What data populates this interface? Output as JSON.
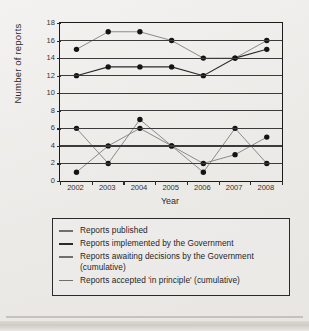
{
  "chart_data": {
    "type": "line",
    "title": "",
    "xlabel": "Year",
    "ylabel": "Number of reports",
    "categories": [
      "2002",
      "2003",
      "2004",
      "2005",
      "2006",
      "2007",
      "2008"
    ],
    "x": [
      2002,
      2003,
      2004,
      2005,
      2006,
      2007,
      2008
    ],
    "xlim": [
      2002,
      2008
    ],
    "ylim": [
      0,
      18
    ],
    "yticks": [
      0,
      2,
      4,
      6,
      8,
      10,
      12,
      14,
      16,
      18
    ],
    "grid": true,
    "legend_position": "below",
    "series": [
      {
        "name": "Reports published",
        "color": "#8a8a8a",
        "values": [
          15,
          17,
          17,
          16,
          14,
          14,
          16
        ]
      },
      {
        "name": "Reports implemented by the Government",
        "color": "#2a2a2a",
        "values": [
          12,
          13,
          13,
          13,
          12,
          14,
          15
        ]
      },
      {
        "name": "Reports awaiting decisions by the Government (cumulative)",
        "color": "#8a8a8a",
        "values": [
          6,
          2,
          7,
          4,
          1,
          6,
          2
        ]
      },
      {
        "name": "Reports accepted 'in principle' (cumulative)",
        "color": "#8a8a8a",
        "values": [
          1,
          4,
          6,
          4,
          2,
          3,
          5
        ]
      }
    ]
  },
  "axis": {
    "ylabel": "Number of reports",
    "xlabel": "Year",
    "yticks": [
      "18",
      "16",
      "14",
      "12",
      "10",
      "8",
      "6",
      "4",
      "2",
      "0"
    ],
    "xticks": [
      "2002",
      "2003",
      "2004",
      "2005",
      "2006",
      "2007",
      "2008"
    ]
  },
  "legend": {
    "items": [
      {
        "label": "Reports published",
        "style": "light"
      },
      {
        "label": "Reports implemented by the Government",
        "style": "dark"
      },
      {
        "label": "Reports awaiting decisions by the Government (cumulative)",
        "style": "light"
      },
      {
        "label": "Reports accepted 'in principle' (cumulative)",
        "style": "light"
      }
    ]
  }
}
